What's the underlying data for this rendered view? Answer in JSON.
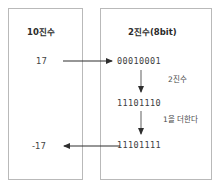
{
  "diagram": {
    "title_decimal": "10진수",
    "title_binary": "2진수(8bit)",
    "decimal_positive": "17",
    "decimal_negative": "-17",
    "binary_original": "00010001",
    "binary_complement": "11101110",
    "binary_twos_complement": "11101111",
    "note_complement": "2진수",
    "note_add_one": "1을 더한다",
    "colors": {
      "box_border": "#b9b9b9",
      "text": "#3a3a3a",
      "arrow": "#2e2e2e",
      "background": "#ffffff"
    }
  }
}
